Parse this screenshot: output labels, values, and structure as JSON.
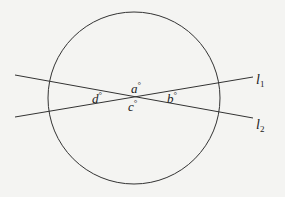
{
  "figure": {
    "type": "geometry-diagram",
    "circle": {
      "cx": 134,
      "cy": 98,
      "r": 86,
      "stroke": "#333333"
    },
    "lines": [
      {
        "name": "l1",
        "label": "l",
        "subscript": "1",
        "x1": 15,
        "y1": 117,
        "x2": 253,
        "y2": 77,
        "label_x": 256,
        "label_y": 84
      },
      {
        "name": "l2",
        "label": "l",
        "subscript": "2",
        "x1": 15,
        "y1": 75,
        "x2": 253,
        "y2": 118,
        "label_x": 256,
        "label_y": 129
      }
    ],
    "intersection": {
      "x": 130,
      "y": 97
    },
    "angles": [
      {
        "name": "a",
        "text": "a",
        "unit": "°",
        "x": 131,
        "y": 93
      },
      {
        "name": "b",
        "text": "b",
        "unit": "°",
        "x": 167,
        "y": 103
      },
      {
        "name": "c",
        "text": "c",
        "unit": "°",
        "x": 128,
        "y": 111
      },
      {
        "name": "d",
        "text": "d",
        "unit": "°",
        "x": 92,
        "y": 103
      }
    ],
    "colors": {
      "stroke": "#333333",
      "text": "#222222",
      "background": "#f4f4f2"
    }
  }
}
